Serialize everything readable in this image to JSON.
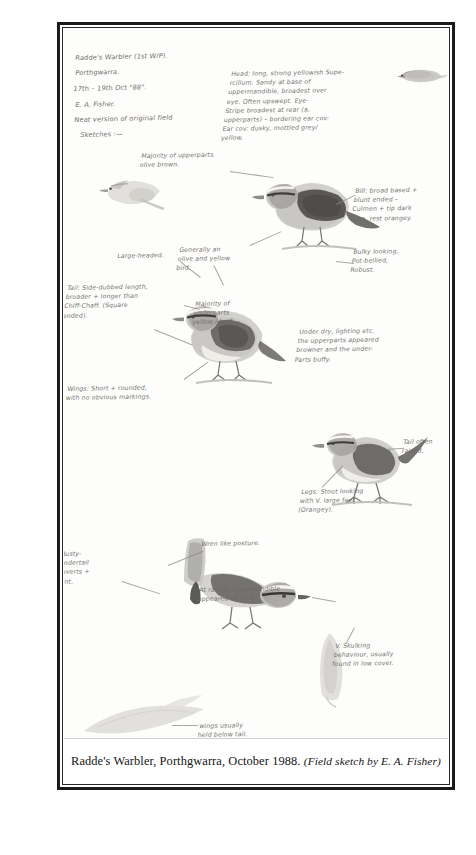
{
  "document": {
    "type": "field-sketch-plate",
    "caption_main": "Radde's Warbler, Porthgwarra, October 1988.",
    "caption_credit": "(Field sketch by E. A. Fisher)"
  },
  "header": {
    "line1": "Radde's Warbler (1st W/P).",
    "line2": "Porthgwarra.",
    "line3": "17th – 19th Oct \"88\".",
    "line4": "E. A. Fisher.",
    "line5": "Neat version of original field",
    "line6": "Sketches :—"
  },
  "annotations": [
    {
      "id": "head-description",
      "text": "Head: long, strong yellowish Supe-\nrcilium. Sandy at base of\nuppermandible, broadest over\neye. Often upswept. Eye-\nStripe broadest at rear (a,\nupperparts) – bordering ear cov:\nEar cov: dusky, mottled grey/\nyellow."
    },
    {
      "id": "upperparts-note",
      "text": "Majority of upperparts\nolive brown."
    },
    {
      "id": "bill-note",
      "text": "Bill: broad based +\nblunt ended –\nCulmen + tip dark\nhorn, rest orangey."
    },
    {
      "id": "belly-note",
      "text": "Bulky looking,\nPot-bellied,\nRobust."
    },
    {
      "id": "general-colour-note",
      "text": "Generally an\nolive and yellow\nbird."
    },
    {
      "id": "large-headed-note",
      "text": "Large-headed."
    },
    {
      "id": "tail-note",
      "text": "Tail: Side-dubbed length,\nbroader + longer than\nChiff-Chaff. (Square\nended)."
    },
    {
      "id": "underparts-note",
      "text": "Majority of\nunderparts\nyellow / buff."
    },
    {
      "id": "wings-note",
      "text": "Wings: Short + rounded,\nwith no obvious markings."
    },
    {
      "id": "lighting-note",
      "text": "Under dry, lighting etc.\nthe upperparts appeared\nbrowner and the under-\nParts buffy."
    },
    {
      "id": "tail-raised-note",
      "text": "Tail often\nraised."
    },
    {
      "id": "legs-note",
      "text": "Legs: Stout looking\nwith V. large feet\n(Orangey)."
    },
    {
      "id": "rusty-vent-note",
      "text": "Rusty-\nundertail\ncoverts +\nvent."
    },
    {
      "id": "wren-posture-note",
      "text": "Wren like posture."
    },
    {
      "id": "orange-mandible-note",
      "text": "At range, uppermandible\nappeared all dark."
    },
    {
      "id": "skulking-note",
      "text": "V. Skulking\nbehaviour, usually\nfound in low cover."
    },
    {
      "id": "wings-below-tail-note",
      "text": "wings usually\nheld below tail."
    }
  ],
  "sketches": [
    {
      "id": "bird-top-right-flight",
      "label": "small-flight-sketch"
    },
    {
      "id": "bird-left-profile-1",
      "label": "pale-profile-head"
    },
    {
      "id": "bird-main-perched-1",
      "label": "perched-side-view"
    },
    {
      "id": "bird-main-perched-2",
      "label": "perched-three-quarter"
    },
    {
      "id": "bird-perched-right",
      "label": "perched-tail-raised"
    },
    {
      "id": "bird-lower-left",
      "label": "wren-posture-head-study"
    },
    {
      "id": "bird-bottom-right",
      "label": "faint-upright-study"
    },
    {
      "id": "bird-bottom-left",
      "label": "faint-wing-tail-study"
    }
  ],
  "colors": {
    "ink": "#6b6a68",
    "caption_text": "#141414",
    "frame": "#1b1b1b",
    "paper": "#fdfdfb"
  }
}
